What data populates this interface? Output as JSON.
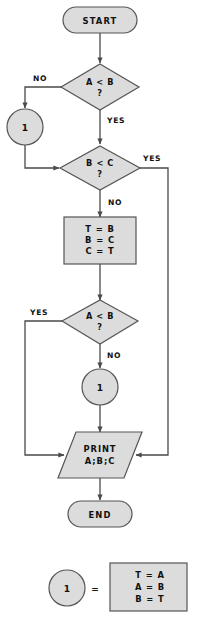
{
  "diagram": {
    "colors": {
      "node_fill": "#dcdcdc",
      "node_stroke": "#555555",
      "edge_stroke": "#4a4a4a",
      "background": "#ffffff",
      "text": "#111111"
    },
    "nodes": {
      "start": {
        "label": "START",
        "shape": "terminal"
      },
      "decision_a_lt_b_1": {
        "line1": "A < B",
        "line2": "?",
        "shape": "decision"
      },
      "connector_1_top": {
        "label": "1",
        "shape": "connector"
      },
      "decision_b_lt_c": {
        "line1": "B < C",
        "line2": "?",
        "shape": "decision"
      },
      "swap_bc": {
        "line1": "T = B",
        "line2": "B = C",
        "line3": "C = T",
        "shape": "process"
      },
      "decision_a_lt_b_2": {
        "line1": "A < B",
        "line2": "?",
        "shape": "decision"
      },
      "connector_1_mid": {
        "label": "1",
        "shape": "connector"
      },
      "print": {
        "line1": "PRINT",
        "line2": "A;B;C",
        "shape": "io"
      },
      "end": {
        "label": "END",
        "shape": "terminal"
      }
    },
    "edge_labels": {
      "no_1": "NO",
      "yes_1": "YES",
      "yes_2": "YES",
      "no_2": "NO",
      "yes_3": "YES",
      "no_3": "NO"
    },
    "legend": {
      "connector_label": "1",
      "equals": "=",
      "box_line1": "T = A",
      "box_line2": "A = B",
      "box_line3": "B = T"
    }
  }
}
